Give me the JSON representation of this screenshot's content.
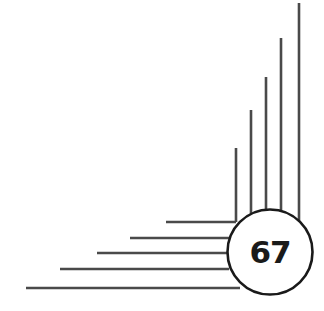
{
  "badge": {
    "number": "67"
  },
  "colors": {
    "line": "#4a4a4a",
    "circle_stroke": "#1a1a1a",
    "background": "#ffffff"
  },
  "vertical_lines": [
    {
      "x": 236,
      "top": 148,
      "bottom": 222
    },
    {
      "x": 251,
      "top": 110,
      "bottom": 214
    },
    {
      "x": 266,
      "top": 77,
      "bottom": 210
    },
    {
      "x": 281,
      "top": 38,
      "bottom": 212
    },
    {
      "x": 299,
      "top": 3,
      "bottom": 226
    }
  ],
  "horizontal_lines": [
    {
      "y": 222,
      "left": 166,
      "right": 236
    },
    {
      "y": 238,
      "left": 130,
      "right": 231
    },
    {
      "y": 253,
      "left": 97,
      "right": 227
    },
    {
      "y": 269,
      "left": 60,
      "right": 229
    },
    {
      "y": 288,
      "left": 26,
      "right": 240
    }
  ]
}
